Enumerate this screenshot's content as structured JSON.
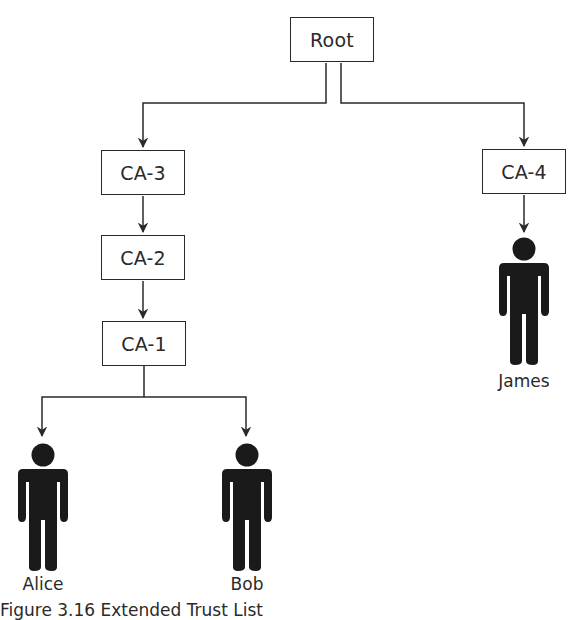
{
  "diagram": {
    "nodes": {
      "root": {
        "label": "Root"
      },
      "ca3": {
        "label": "CA-3"
      },
      "ca2": {
        "label": "CA-2"
      },
      "ca1": {
        "label": "CA-1"
      },
      "ca4": {
        "label": "CA-4"
      }
    },
    "people": {
      "alice": {
        "label": "Alice",
        "icon": "person-icon"
      },
      "bob": {
        "label": "Bob",
        "icon": "person-icon"
      },
      "james": {
        "label": "James",
        "icon": "person-icon"
      }
    },
    "edges": [
      {
        "from": "Root",
        "to": "CA-3"
      },
      {
        "from": "Root",
        "to": "CA-4"
      },
      {
        "from": "CA-3",
        "to": "CA-2"
      },
      {
        "from": "CA-2",
        "to": "CA-1"
      },
      {
        "from": "CA-1",
        "to": "Alice"
      },
      {
        "from": "CA-1",
        "to": "Bob"
      },
      {
        "from": "CA-4",
        "to": "James"
      }
    ],
    "caption": "Figure 3.16  Extended Trust List"
  },
  "colors": {
    "stroke": "#2a2a2a",
    "figure_fill": "#1a1a1a",
    "background": "#ffffff"
  }
}
